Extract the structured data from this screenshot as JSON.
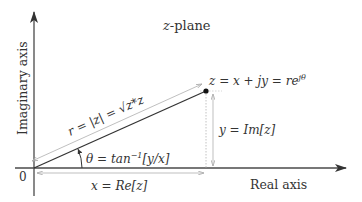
{
  "diagram": {
    "title_var": "z",
    "title_suffix": "-plane",
    "vertical_axis_label": "Imaginary axis",
    "horizontal_axis_label": "Real axis",
    "origin_label": "0",
    "point_label": "z = x + jy = re",
    "point_label_exp": "jθ",
    "magnitude_label": "r = |z| = √z*z",
    "angle_label": "θ = tan",
    "angle_label_exp": "−1",
    "angle_label_tail": "[y/x]",
    "real_part_label": "x = Re[z]",
    "imag_part_label": "y = Im[z]",
    "colors": {
      "axis": "#4a4a4a",
      "vector": "#333333",
      "dimension": "#b8b8b8",
      "text": "#333333"
    }
  }
}
